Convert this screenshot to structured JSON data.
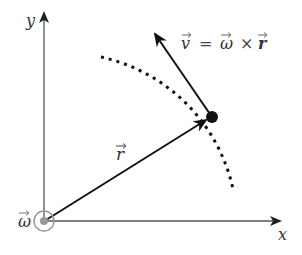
{
  "diagram": {
    "axes": {
      "x_label": "x",
      "y_label": "y"
    },
    "vectors": {
      "r_label": "r",
      "v_equation_lhs": "v",
      "v_equation_eq": "=",
      "v_equation_omega": "ω",
      "v_equation_cross": "×",
      "v_equation_r": "r",
      "omega_label": "ω"
    },
    "elements": [
      {
        "name": "x-axis",
        "from": [
          44,
          221
        ],
        "to": [
          282,
          221
        ]
      },
      {
        "name": "y-axis",
        "from": [
          44,
          221
        ],
        "to": [
          44,
          12
        ]
      },
      {
        "name": "position-vector-r",
        "from": [
          44,
          221
        ],
        "to": [
          212,
          117
        ]
      },
      {
        "name": "velocity-vector-v",
        "from": [
          212,
          117
        ],
        "to": [
          153,
          31
        ]
      },
      {
        "name": "dotted-circular-path",
        "center": [
          44,
          221
        ],
        "passes_through": [
          212,
          117
        ]
      },
      {
        "name": "angular-velocity-omega",
        "at": [
          44,
          221
        ],
        "style": "concentric circles (out of page)"
      }
    ],
    "colors": {
      "arrow": "#111111",
      "axis": "#555555",
      "omega_symbol": "#999999",
      "text": "#333333"
    }
  }
}
